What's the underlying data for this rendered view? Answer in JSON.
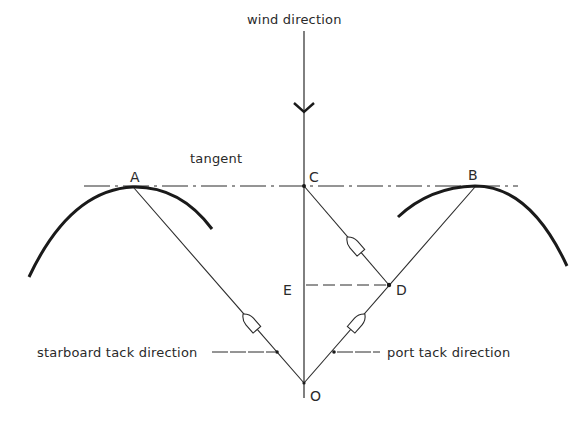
{
  "diagram": {
    "labels": {
      "wind": "wind direction",
      "tangent": "tangent",
      "starboard": "starboard tack direction",
      "port": "port tack direction"
    },
    "points": {
      "A": "A",
      "B": "B",
      "C": "C",
      "D": "D",
      "E": "E",
      "O": "O"
    },
    "colors": {
      "line": "#2a2a2a",
      "curve": "#1a1a1a",
      "background": "#ffffff"
    }
  }
}
